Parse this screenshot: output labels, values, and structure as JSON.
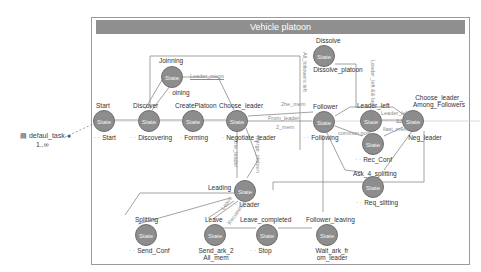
{
  "diagram": {
    "title": "Vehicle platoon",
    "task": {
      "label": "defaul_task",
      "multiplicity": "1..∞",
      "icon": "task-icon"
    },
    "state_glyph": "State",
    "states": [
      {
        "id": "start",
        "name": "Start",
        "action": "Start"
      },
      {
        "id": "discover",
        "name": "Discover",
        "action": "Discovering"
      },
      {
        "id": "joinning",
        "name": "Joinning",
        "action": "oining"
      },
      {
        "id": "createplatoon",
        "name": "CreatePlatoon",
        "action": "Forming"
      },
      {
        "id": "choose_leader",
        "name": "Choose_leader",
        "action": "Negotiate_leader"
      },
      {
        "id": "dissolve",
        "name": "Dissolve",
        "action": "Dissolve_platoon"
      },
      {
        "id": "follower",
        "name": "Follower",
        "action": "Following"
      },
      {
        "id": "leader_left",
        "name": "Leader_left",
        "action": ""
      },
      {
        "id": "rec_conf",
        "name": "",
        "action": "Rec_Conf"
      },
      {
        "id": "choose_leader_among",
        "name": "Choose_leader_ Among_Followers",
        "action": "Neg_leader"
      },
      {
        "id": "ask_4_splitting",
        "name": "Ask_4_splitting",
        "action": "Req_slitting"
      },
      {
        "id": "leading",
        "name": "Leading",
        "action": "Leader"
      },
      {
        "id": "splitting",
        "name": "Splitting",
        "action": "Send_Conf"
      },
      {
        "id": "leave",
        "name": "Leave",
        "action": "Send_ark_2 All_mem"
      },
      {
        "id": "leave_completed",
        "name": "Leave_completed",
        "action": "Stop"
      },
      {
        "id": "follower_leaving",
        "name": "Follower_leaving",
        "action": "Wait_ark_fr om_leader"
      }
    ],
    "transitions": [
      {
        "label": "Leader_mego"
      },
      {
        "label": "2he_mem"
      },
      {
        "label": "From_leader"
      },
      {
        "label": "2_mem"
      },
      {
        "label": "All_followers left"
      },
      {
        "label": "Leader_left && last_mem"
      },
      {
        "label": "Leader_left"
      },
      {
        "label": "&&"
      },
      {
        "label": "llast_mem"
      },
      {
        "label": "common goal"
      },
      {
        "label": "2he_leader"
      },
      {
        "label": "Merge_platoon"
      },
      {
        "label": "Leave"
      },
      {
        "label": "Recommend"
      }
    ]
  }
}
